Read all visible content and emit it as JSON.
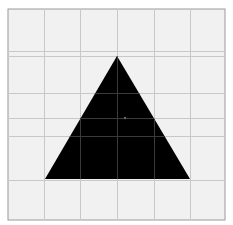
{
  "diagram": {
    "type": "geometric-figure",
    "shape": "triangle",
    "colors": {
      "background": "#ffffff",
      "grid_fill": "#f1f1f1",
      "grid_line": "#c8c8c8",
      "border": "#9a9a9a",
      "shape_fill": "#000000",
      "grid_on_shape": "#3a3a3a",
      "center_dot": "#6a6a6a"
    },
    "frame": {
      "x": 8,
      "y": 9,
      "width": 217,
      "height": 211
    },
    "grid": {
      "vertical_lines_x": [
        44,
        80,
        117,
        154,
        190
      ],
      "horizontal_lines_y": [
        51,
        56,
        93,
        118,
        136,
        180
      ]
    },
    "triangle": {
      "apex": [
        117,
        56
      ],
      "bottom_left": [
        45,
        179
      ],
      "bottom_right": [
        190,
        179
      ]
    },
    "center_dot": {
      "x": 125,
      "y": 118,
      "r": 1.2
    }
  }
}
